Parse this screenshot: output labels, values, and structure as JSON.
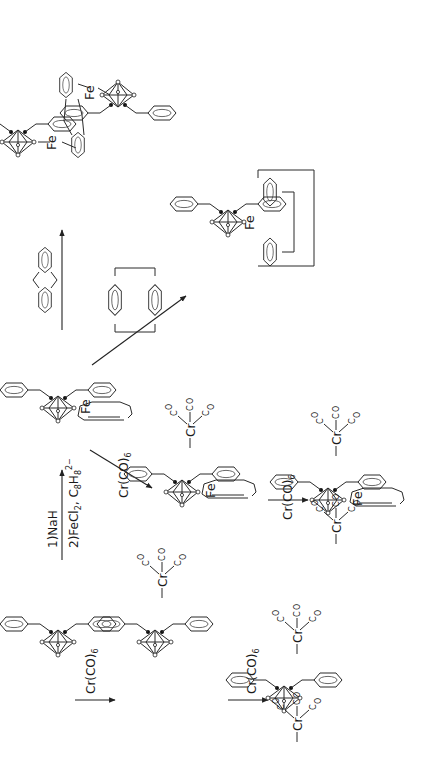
{
  "figure": {
    "orientation": "rotated-90-ccw"
  },
  "reagents": {
    "step1_line1": "1)NaH",
    "step1_line2": "2)FeCl",
    "step1_line2_sub": "2",
    "step1_line2_rest": ", C",
    "step1_c8": "8",
    "step1_h": "H",
    "step1_h8": "8",
    "step1_charge": "2−",
    "cr_co6": "Cr(CO)",
    "cr_co6_sub": "6"
  },
  "labels": {
    "fe": "Fe",
    "cr": "Cr",
    "co": "CO",
    "c": "C",
    "o": "O"
  },
  "compounds": [
    {
      "id": "ligand",
      "name": "dibenzyl-carborane"
    },
    {
      "id": "mono-cr",
      "name": "mono-Cr(CO)3 complex"
    },
    {
      "id": "bis-cr",
      "name": "bis-Cr(CO)3 complex"
    },
    {
      "id": "fe-cot",
      "name": "Fe cyclooctatriene complex"
    },
    {
      "id": "fe-cot-mono-cr",
      "name": "Fe complex with one Cr(CO)3"
    },
    {
      "id": "fe-cot-bis-cr",
      "name": "Fe complex with two Cr(CO)3"
    },
    {
      "id": "fe-paracyclophane",
      "name": "Fe paracyclophane complex"
    },
    {
      "id": "fe2-dihydroanthracene",
      "name": "bis-Fe dihydroanthracene complex"
    }
  ]
}
